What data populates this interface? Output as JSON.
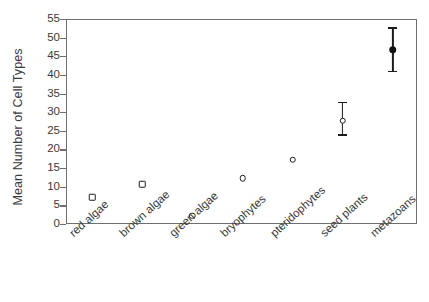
{
  "chart_data": {
    "type": "scatter",
    "title": "",
    "xlabel": "",
    "ylabel": "Mean Number of Cell Types",
    "ylim": [
      0,
      55
    ],
    "ytick_values": [
      0,
      5,
      10,
      15,
      20,
      25,
      30,
      35,
      40,
      45,
      50,
      55
    ],
    "ytick_labels": [
      "0",
      "5",
      "10",
      "15",
      "20",
      "25",
      "30",
      "35",
      "40",
      "45",
      "50",
      "55"
    ],
    "grid": false,
    "legend": null,
    "categories": [
      "red algae",
      "brown algae",
      "green algae",
      "bryophytes",
      "pteridophytes",
      "seed plants",
      "metazoans"
    ],
    "values": [
      7.5,
      11,
      2.5,
      12.5,
      17.5,
      28,
      47
    ],
    "points": [
      {
        "category": "red algae",
        "value": 7.5,
        "marker": "open-square",
        "error_low": null,
        "error_high": null
      },
      {
        "category": "brown algae",
        "value": 11,
        "marker": "open-square",
        "error_low": null,
        "error_high": null
      },
      {
        "category": "green algae",
        "value": 2.5,
        "marker": "open-circle",
        "error_low": null,
        "error_high": null
      },
      {
        "category": "bryophytes",
        "value": 12.5,
        "marker": "open-circle",
        "error_low": null,
        "error_high": null
      },
      {
        "category": "pteridophytes",
        "value": 17.5,
        "marker": "open-circle",
        "error_low": null,
        "error_high": null
      },
      {
        "category": "seed plants",
        "value": 28,
        "marker": "open-circle",
        "error_low": 24,
        "error_high": 33
      },
      {
        "category": "metazoans",
        "value": 47,
        "marker": "filled-circle",
        "error_low": 41,
        "error_high": 53
      }
    ],
    "colors": {
      "marker_edge": "#1c1c1c",
      "marker_fill_open": "#ffffff",
      "marker_fill_solid": "#111111",
      "axis": "#6f6f6f",
      "text": "#3a3a3a",
      "background": "#ffffff"
    }
  }
}
